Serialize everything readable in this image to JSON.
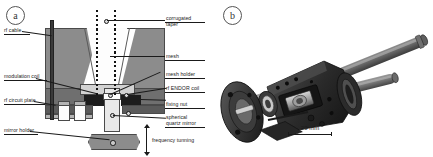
{
  "figure": {
    "panels": [
      {
        "key": "a",
        "letter": "a",
        "caption_label": "panel-a-schematic"
      },
      {
        "key": "b",
        "letter": "b",
        "caption_label": "panel-b-photograph"
      }
    ]
  },
  "panel_a": {
    "letter": "a",
    "labels_right": [
      {
        "name": "corrugated-taper",
        "text": "corrugated\ntaper"
      },
      {
        "name": "mesh",
        "text": "mesh"
      },
      {
        "name": "mesh-holder",
        "text": "mesh holder"
      },
      {
        "name": "rf-endor-coil",
        "text": "rf ENDOR coil"
      },
      {
        "name": "fixing-nut",
        "text": "fixing nut"
      },
      {
        "name": "spherical-quartz-mirror",
        "text": "spherical\nquartz mirror"
      }
    ],
    "labels_left": [
      {
        "name": "rf-cable",
        "text": "rf cable"
      },
      {
        "name": "modulation-coil",
        "text": "modulation coil"
      },
      {
        "name": "rf-circuit-plate",
        "text": "rf circuit plate"
      },
      {
        "name": "mirror-holder",
        "text": "mirror holder"
      }
    ],
    "labels_bottom": [
      {
        "name": "frequency-tunning",
        "text": "frequency tunning"
      }
    ]
  },
  "panel_b": {
    "letter": "b",
    "scale_bar": {
      "text": "20 mm",
      "length_px": 38
    }
  },
  "colors": {
    "body_main": "#8c8c8c",
    "body_dark": "#6f6f6f",
    "body_darker": "#5a5a5a",
    "metal_black": "#1c1c1c",
    "light": "#e8e8e8",
    "white": "#fdfdfd",
    "mid": "#b4b4b4",
    "text": "#1a1a1a",
    "background": "#ffffff"
  }
}
